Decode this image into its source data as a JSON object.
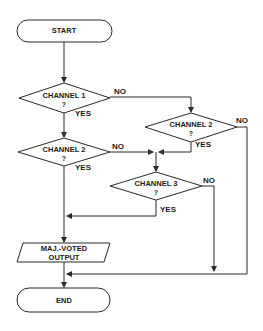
{
  "diagram": {
    "type": "flowchart",
    "colors": {
      "stroke": "#2a2a2a",
      "text": "#1a1a1a",
      "background": "#ffffff"
    },
    "nodes": {
      "start": {
        "shape": "terminal",
        "label": "START"
      },
      "ch1": {
        "shape": "decision",
        "label": "CHANNEL 1",
        "question": "?"
      },
      "ch2_left": {
        "shape": "decision",
        "label": "CHANNEL 2",
        "question": "?"
      },
      "ch2_right": {
        "shape": "decision",
        "label": "CHANNEL 2",
        "question": "?"
      },
      "ch3": {
        "shape": "decision",
        "label": "CHANNEL 3",
        "question": "?"
      },
      "output": {
        "shape": "io",
        "label_line1": "MAJ.-VOTED",
        "label_line2": "OUTPUT"
      },
      "end": {
        "shape": "terminal",
        "label": "END"
      }
    },
    "edges": {
      "ch1_yes": "YES",
      "ch1_no": "NO",
      "ch2_left_yes": "YES",
      "ch2_left_no": "NO",
      "ch2_right_yes": "YES",
      "ch2_right_no": "NO",
      "ch3_yes": "YES",
      "ch3_no": "NO"
    }
  }
}
